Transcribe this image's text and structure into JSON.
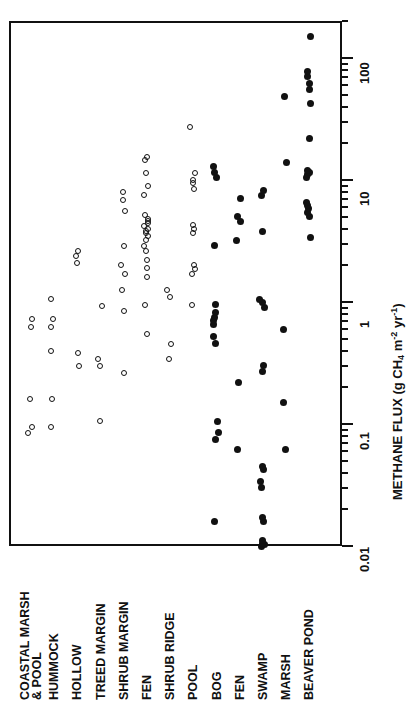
{
  "chart_data": {
    "type": "scatter",
    "title": "",
    "orientation": "horizontal-categories-rotated",
    "xlabel": "",
    "ylabel": "METHANE FLUX (g CH4 m-2 yr-1)",
    "ylabel_parts": {
      "main": "METHANE FLUX (g CH",
      "sub1": "4",
      "mid": " m",
      "sup1": "-2",
      "mid2": " yr",
      "sup2": "-1",
      "close": ")"
    },
    "scale": "log",
    "ylim": [
      0.01,
      200
    ],
    "grid": false,
    "legend": null,
    "tick_labels": [
      "0.01",
      "0.1",
      "1",
      "10",
      "100"
    ],
    "tick_values": [
      0.01,
      0.1,
      1,
      10,
      100
    ],
    "marker_styles": {
      "open": "open circle (unfilled)",
      "filled": "filled circle (solid black)"
    },
    "categories": [
      {
        "label_line1": "COASTAL MARSH",
        "label_line2": "& POOL",
        "marker": "open",
        "values": [
          0.085,
          0.095,
          0.16,
          0.62,
          0.72
        ]
      },
      {
        "label_line1": "HUMMOCK",
        "label_line2": "",
        "marker": "open",
        "values": [
          0.095,
          0.16,
          0.4,
          0.62,
          0.72,
          1.05
        ]
      },
      {
        "label_line1": "HOLLOW",
        "label_line2": "",
        "marker": "open",
        "values": [
          0.3,
          0.38,
          2.1,
          2.4,
          2.6
        ]
      },
      {
        "label_line1": "TREED MARGIN",
        "label_line2": "",
        "marker": "open",
        "values": [
          0.105,
          0.3,
          0.34,
          0.92
        ]
      },
      {
        "label_line1": "SHRUB MARGIN",
        "label_line2": "",
        "marker": "open",
        "values": [
          0.26,
          0.85,
          1.25,
          1.7,
          2.0,
          2.9,
          5.6,
          6.8,
          8.0
        ]
      },
      {
        "label_line1": "FEN",
        "label_line2": "",
        "marker": "open",
        "values": [
          0.55,
          0.95,
          1.6,
          1.9,
          2.2,
          2.6,
          2.9,
          3.2,
          3.5,
          3.7,
          3.8,
          4.0,
          4.2,
          4.4,
          4.6,
          4.8,
          5.2,
          7.5,
          9.0,
          11.5,
          14.5,
          15.5
        ]
      },
      {
        "label_line1": "SHRUB RIDGE",
        "label_line2": "",
        "marker": "open",
        "values": [
          0.34,
          0.45,
          1.1,
          1.25
        ]
      },
      {
        "label_line1": "POOL",
        "label_line2": "",
        "marker": "open",
        "values": [
          0.95,
          1.7,
          1.85,
          2.0,
          3.7,
          4.0,
          4.3,
          8.5,
          9.5,
          10.0,
          11.5,
          27.0
        ]
      },
      {
        "label_line1": "BOG",
        "label_line2": "",
        "marker": "filled",
        "values": [
          0.016,
          0.075,
          0.085,
          0.105,
          0.46,
          0.52,
          0.66,
          0.7,
          0.75,
          0.82,
          0.95,
          2.9,
          10.5,
          11.5,
          13.0
        ]
      },
      {
        "label_line1": "FEN",
        "label_line2": "",
        "marker": "filled",
        "values": [
          0.062,
          0.22,
          3.2,
          4.6,
          5.0,
          7.0
        ]
      },
      {
        "label_line1": "SWAMP",
        "label_line2": "",
        "marker": "filled",
        "values": [
          0.01,
          0.0102,
          0.0105,
          0.011,
          0.016,
          0.017,
          0.03,
          0.034,
          0.042,
          0.045,
          0.27,
          0.3,
          0.9,
          1.0,
          1.05,
          3.8,
          7.5,
          8.2
        ]
      },
      {
        "label_line1": "MARSH",
        "label_line2": "",
        "marker": "filled",
        "values": [
          0.062,
          0.15,
          0.6,
          14.0,
          48.0
        ]
      },
      {
        "label_line1": "BEAVER POND",
        "label_line2": "",
        "marker": "filled",
        "values": [
          3.4,
          5.0,
          5.4,
          5.8,
          6.2,
          6.6,
          10.5,
          11.0,
          11.5,
          12.0,
          22.0,
          42.0,
          55.0,
          62.0,
          70.0,
          78.0,
          150.0
        ]
      }
    ]
  }
}
